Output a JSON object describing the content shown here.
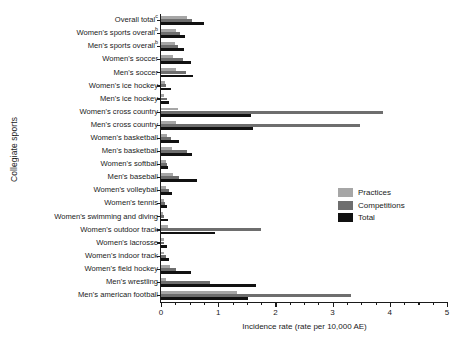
{
  "chart_data": {
    "type": "bar",
    "orientation": "horizontal",
    "title": "",
    "xlabel": "Incidence rate (rate per 10,000 AE)",
    "ylabel": "Collegiate sports",
    "xlim": [
      0,
      5
    ],
    "xticks": [
      0,
      1,
      2,
      3,
      4,
      5
    ],
    "xtick_labels": [
      "0",
      "1",
      "2",
      "3",
      "4",
      "5"
    ],
    "grid": false,
    "legend_position": "center-right",
    "colors": {
      "practices": "#a6a6a6",
      "competitions": "#6e6e6e",
      "total": "#111111",
      "axis": "#1a1a1a",
      "background": "#ffffff"
    },
    "categories": [
      "Overall total",
      "Women's sports overall",
      "Men's sports overall",
      "Women's soccer",
      "Men's soccer",
      "Women's ice hockey",
      "Men's ice hockey",
      "Women's cross country",
      "Men's cross country",
      "Women's basketball",
      "Men's basketball",
      "Women's softball",
      "Men's baseball",
      "Women's volleyball",
      "Women's tennis",
      "Women's swimming and diving",
      "Women's outdoor track",
      "Women's lacrosse",
      "Women's indoor track",
      "Women's field hockey",
      "Men's wrestling",
      "Men's american football"
    ],
    "category_superscripts": [
      "c",
      "b",
      "b",
      "",
      "",
      "",
      "",
      "",
      "",
      "",
      "",
      "",
      "",
      "",
      "",
      "",
      "",
      "",
      "",
      "",
      "",
      ""
    ],
    "series": [
      {
        "name": "Total",
        "color": "#111111",
        "values": [
          0.75,
          0.42,
          0.41,
          0.52,
          0.56,
          0.18,
          0.14,
          1.58,
          1.6,
          0.32,
          0.54,
          0.13,
          0.63,
          0.2,
          0.1,
          0.12,
          0.95,
          0.1,
          0.14,
          0.52,
          1.66,
          1.52
        ]
      },
      {
        "name": "Competitions",
        "color": "#6e6e6e",
        "values": [
          0.54,
          0.34,
          0.3,
          0.39,
          0.43,
          0.09,
          0.11,
          3.88,
          3.48,
          0.17,
          0.46,
          0.1,
          0.31,
          0.14,
          0.07,
          0.06,
          1.75,
          0.05,
          0.08,
          0.27,
          0.86,
          3.33
        ]
      },
      {
        "name": "Practices",
        "color": "#a6a6a6",
        "values": [
          0.45,
          0.26,
          0.24,
          0.21,
          0.26,
          0.07,
          0.05,
          0.3,
          0.26,
          0.1,
          0.2,
          0.08,
          0.21,
          0.09,
          0.05,
          0.04,
          0.12,
          0.06,
          0.06,
          0.16,
          0.08,
          1.32
        ]
      }
    ]
  },
  "legend": {
    "items": [
      {
        "label": "Practices",
        "key": "practices"
      },
      {
        "label": "Competitions",
        "key": "competitions"
      },
      {
        "label": "Total",
        "key": "total"
      }
    ]
  }
}
